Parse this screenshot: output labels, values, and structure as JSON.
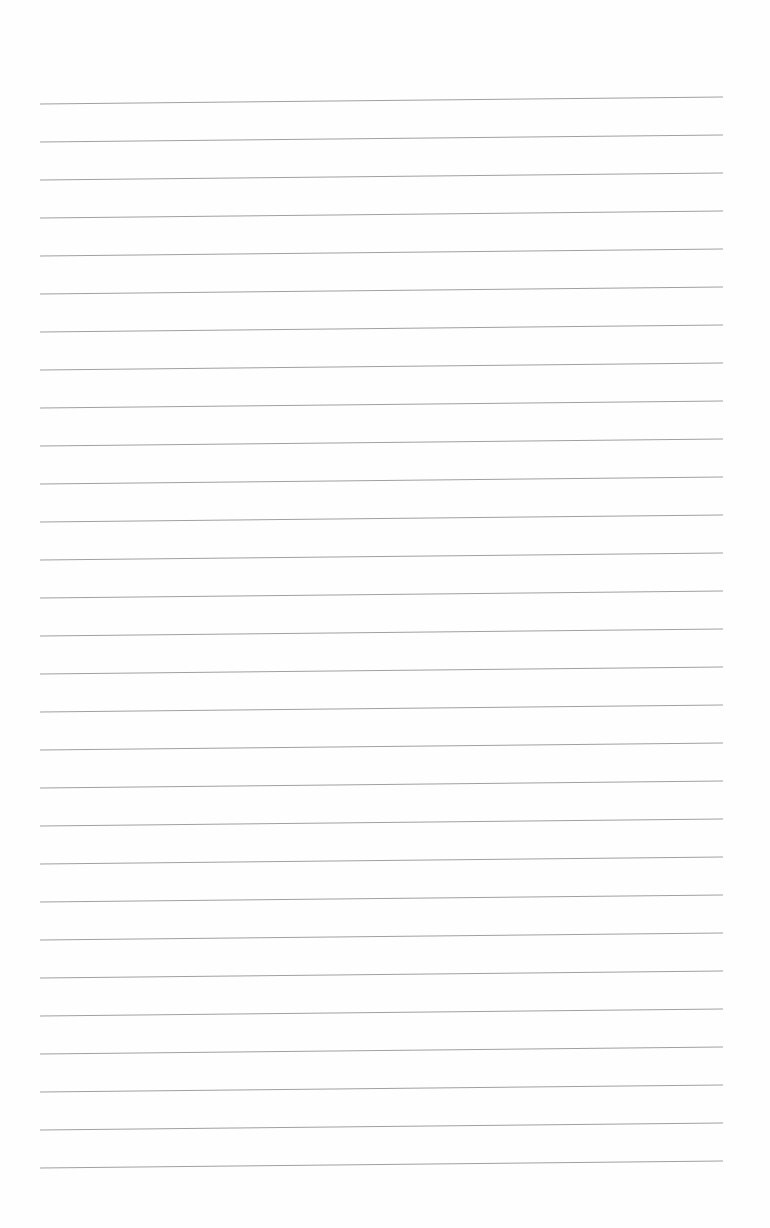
{
  "page": {
    "type": "ruled-notebook-page",
    "background": "#fefefe",
    "line_color": "#a0a0a0",
    "line_count": 29,
    "first_line_left_y": 104,
    "first_line_right_y": 97,
    "line_spacing": 38,
    "line_left_x": 40,
    "line_right_x": 723,
    "text_content": []
  }
}
